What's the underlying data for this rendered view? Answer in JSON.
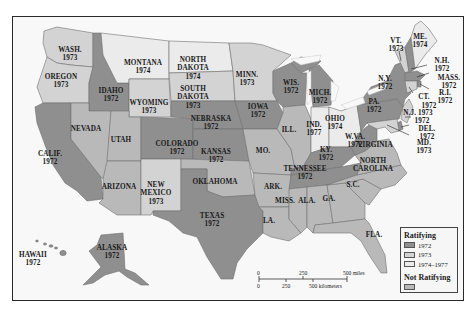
{
  "map": {
    "title": "Ratification of the Equal Rights Amendment",
    "colors": {
      "r1972": "#8f8f8f",
      "r1973": "#d3d3d3",
      "r1974_1977": "#ebebeb",
      "not_ratifying": "#b9b9b9",
      "water": "#f8f8f8",
      "border": "#6e6e6e"
    },
    "states": [
      {
        "name": "WASH.",
        "year": "1973",
        "category": "1973"
      },
      {
        "name": "OREGON",
        "year": "1973",
        "category": "1973"
      },
      {
        "name": "CALIF.",
        "year": "1972",
        "category": "1972"
      },
      {
        "name": "IDAHO",
        "year": "1972",
        "category": "1972"
      },
      {
        "name": "NEVADA",
        "year": "",
        "category": "not_ratifying"
      },
      {
        "name": "MONTANA",
        "year": "1974",
        "category": "1974-1977"
      },
      {
        "name": "WYOMING",
        "year": "1973",
        "category": "1973"
      },
      {
        "name": "UTAH",
        "year": "",
        "category": "not_ratifying"
      },
      {
        "name": "ARIZONA",
        "year": "",
        "category": "not_ratifying"
      },
      {
        "name": "COLORADO",
        "year": "1972",
        "category": "1972"
      },
      {
        "name": "NEW MEXICO",
        "year": "1973",
        "category": "1973"
      },
      {
        "name": "NORTH DAKOTA",
        "year": "1974",
        "category": "1974-1977"
      },
      {
        "name": "SOUTH DAKOTA",
        "year": "1973",
        "category": "1973"
      },
      {
        "name": "NEBRASKA",
        "year": "1972",
        "category": "1972"
      },
      {
        "name": "KANSAS",
        "year": "1972",
        "category": "1972"
      },
      {
        "name": "OKLAHOMA",
        "year": "",
        "category": "not_ratifying"
      },
      {
        "name": "TEXAS",
        "year": "1972",
        "category": "1972"
      },
      {
        "name": "MINN.",
        "year": "1973",
        "category": "1973"
      },
      {
        "name": "IOWA",
        "year": "1972",
        "category": "1972"
      },
      {
        "name": "MO.",
        "year": "",
        "category": "not_ratifying"
      },
      {
        "name": "ARK.",
        "year": "",
        "category": "not_ratifying"
      },
      {
        "name": "LA.",
        "year": "",
        "category": "not_ratifying"
      },
      {
        "name": "WIS.",
        "year": "1972",
        "category": "1972"
      },
      {
        "name": "ILL.",
        "year": "",
        "category": "not_ratifying"
      },
      {
        "name": "MICH.",
        "year": "1972",
        "category": "1972"
      },
      {
        "name": "IND.",
        "year": "1977",
        "category": "1974-1977"
      },
      {
        "name": "OHIO",
        "year": "1974",
        "category": "1974-1977"
      },
      {
        "name": "KY.",
        "year": "1972",
        "category": "1972"
      },
      {
        "name": "TENNESSEE",
        "year": "1972",
        "category": "1972"
      },
      {
        "name": "MISS.",
        "year": "",
        "category": "not_ratifying"
      },
      {
        "name": "ALA.",
        "year": "",
        "category": "not_ratifying"
      },
      {
        "name": "GA.",
        "year": "",
        "category": "not_ratifying"
      },
      {
        "name": "FLA.",
        "year": "",
        "category": "not_ratifying"
      },
      {
        "name": "S.C.",
        "year": "",
        "category": "not_ratifying"
      },
      {
        "name": "NORTH CAROLINA",
        "year": "",
        "category": "not_ratifying"
      },
      {
        "name": "VIRGINIA",
        "year": "",
        "category": "not_ratifying"
      },
      {
        "name": "W.VA.",
        "year": "1972",
        "category": "1972"
      },
      {
        "name": "PA.",
        "year": "1972",
        "category": "1972"
      },
      {
        "name": "N.Y.",
        "year": "1972",
        "category": "1972"
      },
      {
        "name": "VT.",
        "year": "1973",
        "category": "1973"
      },
      {
        "name": "ME.",
        "year": "1974",
        "category": "1974-1977"
      },
      {
        "name": "N.H.",
        "year": "1972",
        "category": "1972"
      },
      {
        "name": "MASS.",
        "year": "1972",
        "category": "1972"
      },
      {
        "name": "R.I.",
        "year": "1972",
        "category": "1972"
      },
      {
        "name": "CT.",
        "year": "1973",
        "category": "1973"
      },
      {
        "name": "N.J.",
        "year": "1973",
        "category": "1973"
      },
      {
        "name": "DEL.",
        "year": "1972",
        "category": "1972"
      },
      {
        "name": "MD.",
        "year": "1973",
        "category": "1973"
      },
      {
        "name": "ALASKA",
        "year": "1972",
        "category": "1972"
      },
      {
        "name": "HAWAII",
        "year": "1972",
        "category": "1972"
      }
    ],
    "labels": {
      "wash": "WASH.",
      "wash_y": "1973",
      "oregon": "OREGON",
      "oregon_y": "1973",
      "calif": "CALIF.",
      "calif_y": "1972",
      "idaho": "IDAHO",
      "idaho_y": "1972",
      "nevada": "NEVADA",
      "montana": "MONTANA",
      "montana_y": "1974",
      "wyoming": "WYOMING",
      "wyoming_y": "1973",
      "utah": "UTAH",
      "arizona": "ARIZONA",
      "colorado": "COLORADO",
      "colorado_y": "1972",
      "newmexico1": "NEW",
      "newmexico2": "MEXICO",
      "newmexico_y": "1973",
      "nd1": "NORTH",
      "nd2": "DAKOTA",
      "nd_y": "1974",
      "sd1": "SOUTH",
      "sd2": "DAKOTA",
      "sd_y": "1973",
      "nebraska": "NEBRASKA",
      "nebraska_y": "1972",
      "kansas": "KANSAS",
      "kansas_y": "1972",
      "oklahoma": "OKLAHOMA",
      "texas": "TEXAS",
      "texas_y": "1972",
      "minn": "MINN.",
      "minn_y": "1973",
      "iowa": "IOWA",
      "iowa_y": "1972",
      "mo": "MO.",
      "ark": "ARK.",
      "la": "LA.",
      "wis": "WIS.",
      "wis_y": "1972",
      "ill": "ILL.",
      "mich": "MICH.",
      "mich_y": "1972",
      "ind": "IND.",
      "ind_y": "1977",
      "ohio": "OHIO",
      "ohio_y": "1974",
      "ky": "KY.",
      "ky_y": "1972",
      "tenn": "TENNESSEE",
      "tenn_y": "1972",
      "miss": "MISS.",
      "ala": "ALA.",
      "ga": "GA.",
      "fla": "FLA.",
      "sc": "S.C.",
      "nc1": "NORTH",
      "nc2": "CAROLINA",
      "va": "VIRGINIA",
      "wva": "W.VA.",
      "wva_y": "1972",
      "pa": "PA.",
      "pa_y": "1972",
      "ny": "N.Y.",
      "ny_y": "1972",
      "vt": "VT.",
      "vt_y": "1973",
      "me": "ME.",
      "me_y": "1974",
      "nh": "N.H.",
      "nh_y": "1972",
      "mass": "MASS.",
      "mass_y": "1972",
      "ri": "R.I.",
      "ri_y": "1972",
      "ct": "CT.",
      "ct_y": "1972",
      "nj": "N.J. 1973",
      "del": "DEL.",
      "del_y": "1972",
      "md": "MD.",
      "md_y": "1973",
      "alaska": "ALASKA",
      "alaska_y": "1972",
      "hawaii": "HAWAII",
      "hawaii_y": "1972"
    },
    "extra": {
      "nj_del_year": "1972"
    }
  },
  "legend": {
    "ratifying_title": "Ratifying",
    "items": [
      {
        "label": "1972",
        "color": "#8f8f8f"
      },
      {
        "label": "1973",
        "color": "#d3d3d3"
      },
      {
        "label": "1974–1977",
        "color": "#ebebeb"
      }
    ],
    "not_ratifying_title": "Not Ratifying",
    "not_ratifying_color": "#b9b9b9"
  },
  "scale_bar": {
    "miles_0": "0",
    "miles_250": "250",
    "miles_500": "500 miles",
    "km_0": "0",
    "km_250": "250",
    "km_500": "500 kilometers"
  }
}
